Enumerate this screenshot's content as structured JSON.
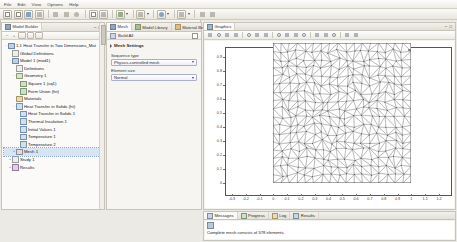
{
  "menubar": {
    "items": [
      "File",
      "Edit",
      "View",
      "Options",
      "Help"
    ]
  },
  "toolbar": {
    "icons": [
      "new-file-icon",
      "open-file-icon",
      "save-icon",
      "print-icon",
      "undo-icon",
      "redo-icon",
      "copy-icon",
      "paste-icon",
      "delete-icon",
      "build-mesh-icon",
      "compute-icon",
      "zoom-extents-icon",
      "plot-icon",
      "model-library-icon",
      "preferences-icon"
    ]
  },
  "model_builder": {
    "tab_label": "Model Builder",
    "toolbar_icons": [
      "collapse-all-icon",
      "expand-all-icon",
      "show-icon",
      "filter-icon",
      "root-icon"
    ],
    "tree": [
      {
        "label": "1.1 Heat Transfer in Two Dimensions_Mat",
        "icon": "root-icon",
        "depth": 0,
        "expander": "-",
        "icon_class": "root",
        "selected": false
      },
      {
        "label": "Global Definitions",
        "icon": "global-definitions-icon",
        "depth": 1,
        "expander": "",
        "icon_class": "node",
        "selected": false
      },
      {
        "label": "Model 1 (mod1)",
        "icon": "model-icon",
        "depth": 1,
        "expander": "-",
        "icon_class": "root",
        "selected": false
      },
      {
        "label": "Definitions",
        "icon": "definitions-icon",
        "depth": 2,
        "expander": "",
        "icon_class": "node",
        "selected": false
      },
      {
        "label": "Geometry 1",
        "icon": "geometry-icon",
        "depth": 2,
        "expander": "-",
        "icon_class": "geo",
        "selected": false
      },
      {
        "label": "Square 1 (sq1)",
        "icon": "square-icon",
        "depth": 3,
        "expander": "",
        "icon_class": "sq",
        "selected": false
      },
      {
        "label": "Form Union (fin)",
        "icon": "form-union-icon",
        "depth": 3,
        "expander": "",
        "icon_class": "sq",
        "selected": false
      },
      {
        "label": "Materials",
        "icon": "materials-icon",
        "depth": 2,
        "expander": "",
        "icon_class": "mat",
        "selected": false
      },
      {
        "label": "Heat Transfer in Solids (ht)",
        "icon": "physics-icon",
        "depth": 2,
        "expander": "-",
        "icon_class": "phys",
        "selected": false
      },
      {
        "label": "Heat Transfer in Solids 1",
        "icon": "heat-transfer-solids-icon",
        "depth": 3,
        "expander": "",
        "icon_class": "phys",
        "selected": false
      },
      {
        "label": "Thermal Insulation 1",
        "icon": "thermal-insulation-icon",
        "depth": 3,
        "expander": "",
        "icon_class": "phys",
        "selected": false
      },
      {
        "label": "Initial Values 1",
        "icon": "initial-values-icon",
        "depth": 3,
        "expander": "",
        "icon_class": "phys",
        "selected": false
      },
      {
        "label": "Temperature 1",
        "icon": "temperature-icon",
        "depth": 3,
        "expander": "",
        "icon_class": "phys",
        "selected": false
      },
      {
        "label": "Temperature 2",
        "icon": "temperature-icon",
        "depth": 3,
        "expander": "",
        "icon_class": "phys",
        "selected": false
      },
      {
        "label": "Mesh 1",
        "icon": "mesh-icon",
        "depth": 2,
        "expander": "+",
        "icon_class": "mesh",
        "selected": true
      },
      {
        "label": "Study 1",
        "icon": "study-icon",
        "depth": 1,
        "expander": "+",
        "icon_class": "node",
        "selected": false
      },
      {
        "label": "Results",
        "icon": "results-icon",
        "depth": 1,
        "expander": "+",
        "icon_class": "res",
        "selected": false
      }
    ]
  },
  "settings_panel": {
    "tabs": [
      {
        "label": "Mesh",
        "icon": "mesh-icon",
        "active": true
      },
      {
        "label": "Model Library",
        "icon": "model-library-icon",
        "active": false
      },
      {
        "label": "Material Bro...",
        "icon": "material-browser-icon",
        "active": false
      }
    ],
    "title": "Build All",
    "title_icon": "build-all-icon",
    "section_title": "Mesh Settings",
    "fields": [
      {
        "label": "Sequence type",
        "value": "Physics-controlled mesh",
        "name": "sequence-type-select"
      },
      {
        "label": "Element size",
        "value": "Normal",
        "name": "element-size-select"
      }
    ]
  },
  "graphics_panel": {
    "tab_label": "Graphics",
    "tab_icon": "graphics-icon",
    "toolbar_icons": [
      "zoom-in-icon",
      "zoom-out-icon",
      "zoom-extents-icon",
      "zoom-box-icon",
      "go-to-default-view-icon",
      "scene-light-icon",
      "transparency-icon",
      "select-points-icon",
      "select-edges-icon",
      "select-boundaries-icon",
      "select-domains-icon",
      "measure-icon",
      "image-snapshot-icon",
      "print-graphics-icon",
      "reset-view-icon",
      "grid-icon"
    ]
  },
  "chart_data": {
    "type": "mesh",
    "title": "",
    "xlabel": "",
    "ylabel": "",
    "xlim": [
      -0.35,
      1.28
    ],
    "ylim": [
      -0.08,
      0.97
    ],
    "xticks": [
      "-0.3",
      "-0.2",
      "-0.1",
      "0",
      "0.1",
      "0.2",
      "0.3",
      "0.4",
      "0.5",
      "0.6",
      "0.7",
      "0.8",
      "0.9",
      "1",
      "1.1",
      "1.2"
    ],
    "yticks": [
      "0.9",
      "0.8",
      "0.7",
      "0.6",
      "0.5",
      "0.4",
      "0.3",
      "0.2",
      "0.1",
      "0"
    ],
    "grid": false,
    "domain_rect": {
      "x0": 0,
      "y0": 0,
      "x1": 1,
      "y1": 1
    },
    "mesh_description": "Triangular free mesh on unit square",
    "element_count": 578
  },
  "message_panel": {
    "tabs": [
      {
        "label": "Messages",
        "icon": "messages-icon",
        "active": true
      },
      {
        "label": "Progress",
        "icon": "progress-icon",
        "active": false
      },
      {
        "label": "Log",
        "icon": "log-icon",
        "active": false
      },
      {
        "label": "Results",
        "icon": "results-table-icon",
        "active": false
      }
    ],
    "message": "Complete mesh consists of 578 elements.",
    "message_icon": "mesh-info-icon"
  }
}
